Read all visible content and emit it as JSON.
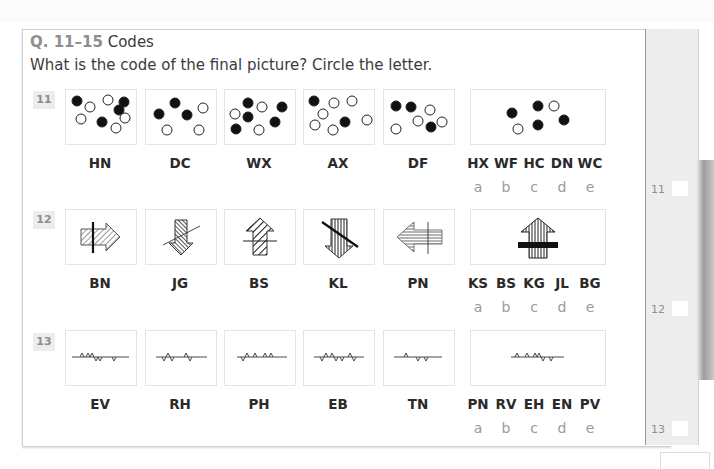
{
  "header": {
    "q_label": "Q. 11–15",
    "title": "Codes",
    "instruction": "What is the code of the final picture? Circle the letter."
  },
  "questions": [
    {
      "number": "11",
      "codes": [
        "HN",
        "DC",
        "WX",
        "AX",
        "DF"
      ],
      "options": [
        "HX",
        "WF",
        "HC",
        "DN",
        "WC"
      ],
      "letters": [
        "a",
        "b",
        "c",
        "d",
        "e"
      ],
      "figure_type": "dots"
    },
    {
      "number": "12",
      "codes": [
        "BN",
        "JG",
        "BS",
        "KL",
        "PN"
      ],
      "options": [
        "KS",
        "BS",
        "KG",
        "JL",
        "BG"
      ],
      "letters": [
        "a",
        "b",
        "c",
        "d",
        "e"
      ],
      "figure_type": "arrows"
    },
    {
      "number": "13",
      "codes": [
        "EV",
        "RH",
        "PH",
        "EB",
        "TN"
      ],
      "options": [
        "PN",
        "RV",
        "EH",
        "EN",
        "PV"
      ],
      "letters": [
        "a",
        "b",
        "c",
        "d",
        "e"
      ],
      "figure_type": "zigzag-lines"
    }
  ],
  "answer_margin": {
    "labels": [
      "11",
      "12",
      "13"
    ]
  },
  "colors": {
    "q_label": "#8e8e8e",
    "text": "#3b3b3b",
    "letters": "#9a9a9a",
    "margin_bg": "#ededed"
  }
}
